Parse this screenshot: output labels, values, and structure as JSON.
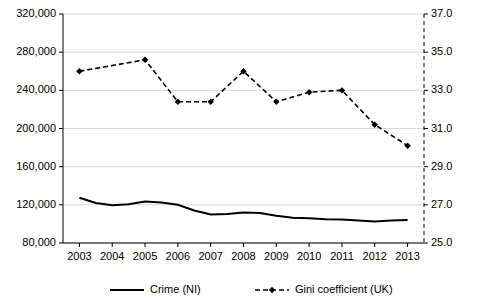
{
  "chart_data": {
    "type": "line",
    "title": "",
    "xlabel": "",
    "ylabel": "",
    "categories": [
      "2003",
      "2004",
      "2005",
      "2006",
      "2007",
      "2008",
      "2009",
      "2010",
      "2011",
      "2012",
      "2013"
    ],
    "left_axis": {
      "label": "",
      "ylim": [
        80000,
        320000
      ],
      "ticks": [
        "80,000",
        "120,000",
        "160,000",
        "200,000",
        "240,000",
        "280,000",
        "320,000"
      ],
      "tick_values": [
        80000,
        120000,
        160000,
        200000,
        240000,
        280000,
        320000
      ]
    },
    "right_axis": {
      "label": "",
      "ylim": [
        25.0,
        37.0
      ],
      "ticks": [
        "25.0",
        "27.0",
        "29.0",
        "31.0",
        "33.0",
        "35.0",
        "37.0"
      ],
      "tick_values": [
        25.0,
        27.0,
        29.0,
        31.0,
        33.0,
        35.0,
        37.0
      ]
    },
    "grid": "horizontal",
    "legend_position": "bottom",
    "series": [
      {
        "name": "Crime (NI)",
        "axis": "left",
        "style": "solid",
        "color": "#000000",
        "x": [
          2003,
          2003.5,
          2004,
          2004.5,
          2005,
          2005.5,
          2006,
          2006.5,
          2007,
          2007.5,
          2008,
          2008.5,
          2009,
          2009.5,
          2010,
          2010.5,
          2011,
          2011.5,
          2012,
          2012.5,
          2013
        ],
        "values": [
          127500,
          122000,
          119500,
          120500,
          123500,
          122500,
          120000,
          114000,
          110000,
          110500,
          112000,
          111500,
          108500,
          106500,
          106000,
          105000,
          104500,
          103500,
          102500,
          103500,
          104000
        ]
      },
      {
        "name": "Gini coefficient (UK)",
        "axis": "right",
        "style": "dashed-marker",
        "color": "#000000",
        "x": [
          2003,
          2004,
          2005,
          2006,
          2007,
          2008,
          2009,
          2010,
          2011,
          2012,
          2013
        ],
        "values": [
          34.0,
          null,
          34.6,
          32.4,
          32.4,
          34.0,
          32.4,
          32.9,
          33.0,
          31.2,
          30.1
        ]
      }
    ],
    "legend": [
      {
        "name": "Crime (NI)",
        "style": "solid"
      },
      {
        "name": "Gini coefficient (UK)",
        "style": "dashed-marker"
      }
    ]
  }
}
